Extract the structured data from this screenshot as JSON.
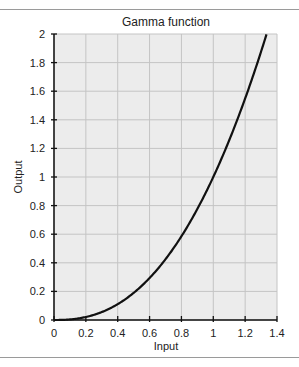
{
  "chart_data": {
    "type": "line",
    "title": "Gamma function",
    "xlabel": "Input",
    "ylabel": "Output",
    "xlim": [
      0,
      1.4
    ],
    "ylim": [
      0,
      2
    ],
    "xticks": [
      "0",
      "0.2",
      "0.4",
      "0.6",
      "0.8",
      "1",
      "1.2",
      "1.4"
    ],
    "yticks": [
      "0",
      "0.2",
      "0.4",
      "0.6",
      "0.8",
      "1",
      "1.2",
      "1.4",
      "1.6",
      "1.8",
      "2"
    ],
    "grid": true,
    "series": [
      {
        "name": "gamma curve (y = x^2.4)",
        "x": [
          0,
          0.1,
          0.2,
          0.3,
          0.4,
          0.5,
          0.6,
          0.7,
          0.8,
          0.9,
          1.0,
          1.1,
          1.2,
          1.3,
          1.334
        ],
        "y": [
          0,
          0.004,
          0.021,
          0.056,
          0.111,
          0.189,
          0.293,
          0.425,
          0.585,
          0.776,
          1.0,
          1.257,
          1.549,
          1.877,
          2.0
        ],
        "color": "#111111"
      }
    ]
  }
}
